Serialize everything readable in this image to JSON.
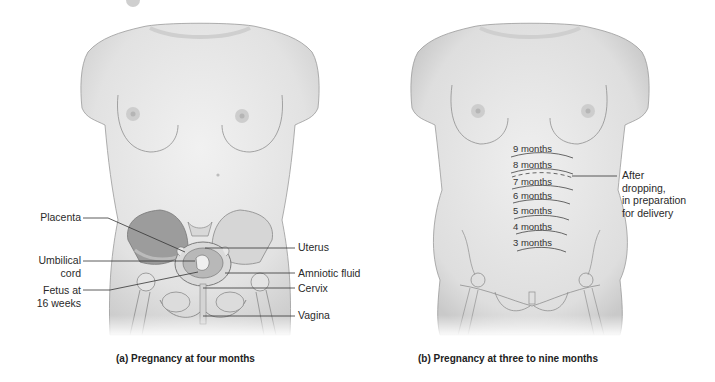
{
  "panels": [
    {
      "id": "a",
      "caption": "(a) Pregnancy at four months",
      "labels_left": [
        {
          "text": "Placenta"
        },
        {
          "text": "Umbilical\ncord",
          "line1": "Umbilical",
          "line2": "cord"
        },
        {
          "text": "Fetus at\n16 weeks",
          "line1": "Fetus at",
          "line2": "16 weeks"
        }
      ],
      "labels_right": [
        {
          "text": "Uterus"
        },
        {
          "text": "Amniotic fluid"
        },
        {
          "text": "Cervix"
        },
        {
          "text": "Vagina"
        }
      ]
    },
    {
      "id": "b",
      "caption": "(b) Pregnancy at three to nine months",
      "month_labels": [
        "9 months",
        "8 months",
        "7 months",
        "6 months",
        "5 months",
        "4 months",
        "3 months"
      ],
      "annotation": {
        "line1": "After",
        "line2": "dropping,",
        "line3": "in preparation",
        "line4": "for delivery"
      }
    }
  ],
  "colors": {
    "skin": "#e9e9e9",
    "skin_shade": "#cfcfcf",
    "outline": "#8a8a8a",
    "bone": "#dcdcdc",
    "leader": "#333333"
  }
}
